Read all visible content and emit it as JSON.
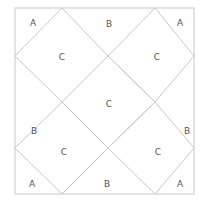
{
  "diagram": {
    "type": "geometric-tiling",
    "stroke_color": "#c8c8c8",
    "label_color": "#555555",
    "outer_square": {
      "x": 15,
      "y": 8,
      "width": 179,
      "height": 186
    },
    "diamonds": [
      {
        "name": "diamond-top-left",
        "points": "62,8 108,56 62,102 15,56"
      },
      {
        "name": "diamond-top-right",
        "points": "155,8 194,56 155,102 108,56"
      },
      {
        "name": "diamond-center",
        "points": "108,56 155,102 108,148 62,102"
      },
      {
        "name": "diamond-bottom-left",
        "points": "62,102 108,148 62,194 15,148"
      },
      {
        "name": "diamond-bottom-right",
        "points": "155,102 194,148 155,194 108,148"
      }
    ],
    "labels": [
      {
        "name": "label-a-top-left",
        "text": "A",
        "x": 33,
        "y": 23
      },
      {
        "name": "label-b-top",
        "text": "B",
        "x": 109,
        "y": 24
      },
      {
        "name": "label-a-top-right",
        "text": "A",
        "x": 180,
        "y": 23
      },
      {
        "name": "label-c-top-left",
        "text": "C",
        "x": 62,
        "y": 57
      },
      {
        "name": "label-c-top-right",
        "text": "C",
        "x": 157,
        "y": 57
      },
      {
        "name": "label-b-left",
        "text": "B",
        "x": 34,
        "y": 131
      },
      {
        "name": "label-c-center",
        "text": "C",
        "x": 109,
        "y": 104
      },
      {
        "name": "label-b-right",
        "text": "B",
        "x": 187,
        "y": 131
      },
      {
        "name": "label-c-bottom-left",
        "text": "C",
        "x": 64,
        "y": 152
      },
      {
        "name": "label-c-bottom-right",
        "text": "C",
        "x": 158,
        "y": 152
      },
      {
        "name": "label-a-bottom-left",
        "text": "A",
        "x": 32,
        "y": 184
      },
      {
        "name": "label-b-bottom",
        "text": "B",
        "x": 107,
        "y": 184
      },
      {
        "name": "label-a-bottom-right",
        "text": "A",
        "x": 180,
        "y": 184
      }
    ]
  }
}
